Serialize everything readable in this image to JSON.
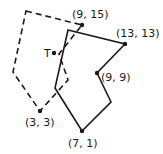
{
  "diagram": {
    "solid_polygon": {
      "style": "solid",
      "vertices_px": [
        [
          68,
          30
        ],
        [
          125,
          44
        ],
        [
          97,
          73
        ],
        [
          111,
          102
        ],
        [
          82,
          131
        ],
        [
          55,
          88
        ]
      ]
    },
    "dashed_polygon": {
      "style": "dashed",
      "vertices_px": [
        [
          26,
          11
        ],
        [
          82,
          25
        ],
        [
          59,
          54
        ],
        [
          68,
          80
        ],
        [
          40,
          111
        ],
        [
          13,
          72
        ]
      ]
    },
    "points": [
      {
        "label": "(9, 15)",
        "px": [
          82,
          25
        ],
        "label_pos": [
          72,
          18
        ]
      },
      {
        "label": "(13, 13)",
        "px": [
          125,
          44
        ],
        "label_pos": [
          116,
          37
        ]
      },
      {
        "label": "(9, 9)",
        "px": [
          97,
          73
        ],
        "label_pos": [
          101,
          81
        ]
      },
      {
        "label": "(7, 1)",
        "px": [
          82,
          131
        ],
        "label_pos": [
          68,
          147
        ]
      },
      {
        "label": "(3, 3)",
        "px": [
          40,
          111
        ],
        "label_pos": [
          25,
          126
        ]
      },
      {
        "label": "T",
        "px": [
          54,
          53
        ],
        "label_pos": [
          44,
          57
        ]
      }
    ],
    "colors": {
      "line": "#1a1a1a",
      "background": "#ffffff"
    }
  }
}
